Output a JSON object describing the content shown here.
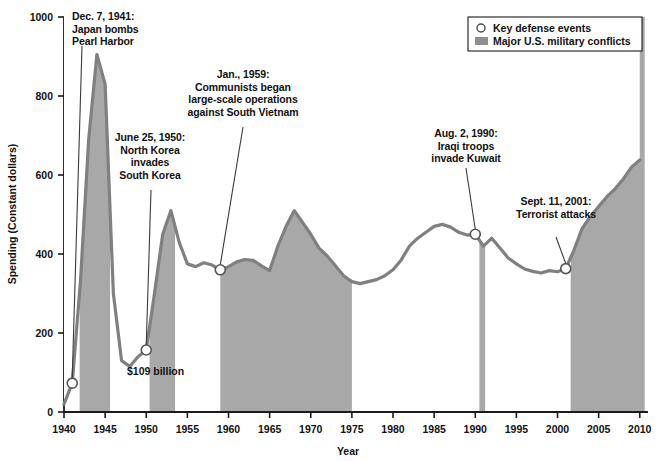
{
  "legend": {
    "position": "top-right",
    "items": [
      {
        "marker": "circle-open-icon",
        "label": "Key defense events"
      },
      {
        "marker": "filled-square-icon",
        "label": "Major U.S. military conflicts"
      }
    ]
  },
  "axes": {
    "x_title": "Year",
    "y_title": "Spending (Constant dollars)",
    "x_ticks": [
      "1940",
      "1945",
      "1950",
      "1955",
      "1960",
      "1965",
      "1970",
      "1975",
      "1980",
      "1985",
      "1990",
      "1995",
      "2000",
      "2005",
      "2010"
    ],
    "y_ticks": [
      "0",
      "200",
      "400",
      "600",
      "800",
      "1000"
    ]
  },
  "annotations": [
    {
      "id": "pearl-harbor",
      "text": "Dec. 7, 1941:\nJapan bombs\nPearl Harbor",
      "align": "left"
    },
    {
      "id": "korea",
      "text": "June 25, 1950:\nNorth Korea\ninvades\nSouth Korea",
      "align": "center"
    },
    {
      "id": "vietnam",
      "text": "Jan., 1959:\nCommunists began\nlarge-scale operations\nagainst South Vietnam",
      "align": "center"
    },
    {
      "id": "kuwait",
      "text": "Aug. 2, 1990:\nIraqi troops\ninvade Kuwait",
      "align": "center"
    },
    {
      "id": "sept11",
      "text": "Sept. 11, 2001:\nTerrorist attacks",
      "align": "center"
    },
    {
      "id": "value-1950",
      "text": "$109 billion",
      "align": "left"
    }
  ],
  "colors": {
    "line": "#808080",
    "band_fill": "#a8a8a8",
    "axis": "#1a1a1a",
    "marker_stroke": "#555555",
    "marker_fill": "#ffffff",
    "background": "#ffffff"
  },
  "chart_data": {
    "type": "area",
    "title": "",
    "subtitle": "",
    "xlabel": "Year",
    "ylabel": "Spending (Constant dollars)",
    "xlim": [
      1940,
      2011
    ],
    "ylim": [
      0,
      1000
    ],
    "grid": false,
    "legend_position": "top-right",
    "series": [
      {
        "name": "U.S. defense spending (constant dollars, billions)",
        "x": [
          1940,
          1941,
          1942,
          1943,
          1944,
          1945,
          1946,
          1947,
          1948,
          1949,
          1950,
          1951,
          1952,
          1953,
          1954,
          1955,
          1956,
          1957,
          1958,
          1959,
          1960,
          1961,
          1962,
          1963,
          1964,
          1965,
          1966,
          1967,
          1968,
          1969,
          1970,
          1971,
          1972,
          1973,
          1974,
          1975,
          1976,
          1977,
          1978,
          1979,
          1980,
          1981,
          1982,
          1983,
          1984,
          1985,
          1986,
          1987,
          1988,
          1989,
          1990,
          1991,
          1992,
          1993,
          1994,
          1995,
          1996,
          1997,
          1998,
          1999,
          2000,
          2001,
          2002,
          2003,
          2004,
          2005,
          2006,
          2007,
          2008,
          2009,
          2010
        ],
        "y": [
          20,
          73,
          330,
          690,
          905,
          830,
          300,
          130,
          115,
          140,
          157,
          300,
          450,
          510,
          430,
          375,
          368,
          378,
          372,
          360,
          368,
          380,
          386,
          384,
          370,
          358,
          420,
          470,
          510,
          480,
          450,
          415,
          395,
          370,
          345,
          330,
          325,
          330,
          335,
          345,
          360,
          385,
          420,
          440,
          455,
          470,
          475,
          468,
          455,
          448,
          450,
          420,
          440,
          415,
          390,
          375,
          362,
          356,
          352,
          358,
          355,
          363,
          410,
          465,
          495,
          520,
          545,
          565,
          590,
          620,
          638
        ]
      }
    ],
    "shaded_bands": [
      {
        "label": "World War II",
        "start": 1941.9,
        "end": 1945.6
      },
      {
        "label": "Korean War",
        "start": 1950.4,
        "end": 1953.5
      },
      {
        "label": "Vietnam War",
        "start": 1959.0,
        "end": 1975.0
      },
      {
        "label": "Persian Gulf War",
        "start": 1990.5,
        "end": 1991.2
      },
      {
        "label": "War on Terror / Iraq & Afghanistan",
        "start": 2001.6,
        "end": 2010.6
      }
    ],
    "event_markers": [
      {
        "label": "Dec. 7, 1941: Japan bombs Pearl Harbor",
        "x": 1941,
        "y": 73
      },
      {
        "label": "June 25, 1950: North Korea invades South Korea",
        "x": 1950,
        "y": 157
      },
      {
        "label": "Jan., 1959: Communists began large-scale operations against South Vietnam",
        "x": 1959,
        "y": 360
      },
      {
        "label": "Aug. 2, 1990: Iraqi troops invade Kuwait",
        "x": 1990,
        "y": 450
      },
      {
        "label": "Sept. 11, 2001: Terrorist attacks",
        "x": 2001,
        "y": 363
      }
    ],
    "data_labels": [
      {
        "text": "$109 billion",
        "x": 1950,
        "y": 109
      }
    ]
  }
}
